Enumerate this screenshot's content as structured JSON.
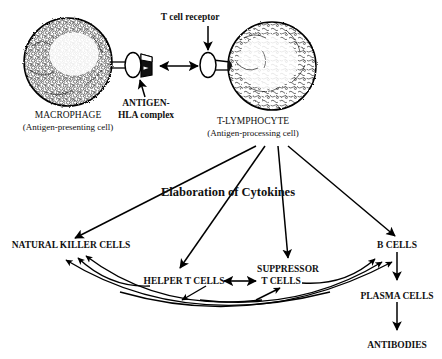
{
  "top_section": {
    "t_cell_receptor_label": "T cell receptor",
    "antigen_label_line1": "ANTIGEN-",
    "antigen_label_line2": "HLA complex",
    "macrophage_name": "MACROPHAGE",
    "macrophage_sub": "(Antigen-presenting cell)",
    "lymphocyte_name": "T-LYMPHOCYTE",
    "lymphocyte_sub": "(Antigen-processing cell)"
  },
  "middle_section": {
    "cytokines_label": "Elaboration of Cytokines"
  },
  "nodes": {
    "natural_killer": "NATURAL KILLER CELLS",
    "helper_t": "HELPER T CELLS",
    "suppressor_line1": "SUPPRESSOR",
    "suppressor_line2": "T CELLS",
    "b_cells": "B CELLS",
    "plasma_cells": "PLASMA CELLS",
    "antibodies": "ANTIBODIES"
  },
  "colors": {
    "ink": "#000000",
    "background": "#ffffff"
  },
  "diagram_data": {
    "type": "diagram",
    "flow": [
      {
        "from": "MACROPHAGE",
        "to": "T-LYMPHOCYTE",
        "via": "ANTIGEN-HLA complex / T cell receptor",
        "arrow": "bidirectional"
      },
      {
        "from": "T-LYMPHOCYTE",
        "to": "NATURAL KILLER CELLS",
        "arrow": "single"
      },
      {
        "from": "T-LYMPHOCYTE",
        "to": "HELPER T CELLS",
        "arrow": "single"
      },
      {
        "from": "T-LYMPHOCYTE",
        "to": "SUPPRESSOR T CELLS",
        "arrow": "single"
      },
      {
        "from": "T-LYMPHOCYTE",
        "to": "B CELLS",
        "arrow": "single"
      },
      {
        "from": "HELPER T CELLS",
        "to": "SUPPRESSOR T CELLS",
        "arrow": "bidirectional"
      },
      {
        "from": "HELPER T CELLS",
        "to": "NATURAL KILLER CELLS",
        "arrow": "single"
      },
      {
        "from": "HELPER T CELLS",
        "to": "B CELLS",
        "arrow": "single"
      },
      {
        "from": "SUPPRESSOR T CELLS",
        "to": "NATURAL KILLER CELLS",
        "arrow": "single"
      },
      {
        "from": "SUPPRESSOR T CELLS",
        "to": "B CELLS",
        "arrow": "single"
      },
      {
        "from": "NATURAL KILLER CELLS",
        "to": "B CELLS",
        "arrow": "bidirectional-arc"
      },
      {
        "from": "B CELLS",
        "to": "PLASMA CELLS",
        "arrow": "single"
      },
      {
        "from": "PLASMA CELLS",
        "to": "ANTIBODIES",
        "arrow": "single"
      }
    ]
  }
}
